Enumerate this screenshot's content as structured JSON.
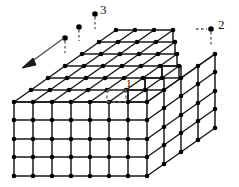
{
  "figure": {
    "width": 239,
    "height": 187,
    "background_color": "#ffffff",
    "line_color": "#1a1a1a",
    "atom_color": "#000000",
    "dashed_color": "#555555",
    "arrow_color": "#1a1a1a"
  },
  "lattice": {
    "front_face": {
      "columns": 7,
      "rows": 4
    },
    "right_face": {
      "columns": 4,
      "rows": 4
    },
    "top_face": {
      "columns": 7,
      "rows": 6
    },
    "step_height_cells": 1,
    "terrace_count": 3
  },
  "labels": [
    {
      "id": "label-1",
      "text": "1",
      "x": 126,
      "y": 83,
      "kind": "kink-site"
    },
    {
      "id": "label-2",
      "text": "2",
      "x": 219,
      "y": 24,
      "kind": "adatom-site"
    },
    {
      "id": "label-3",
      "text": "3",
      "x": 100,
      "y": 8,
      "kind": "terrace-adatom-site"
    }
  ],
  "markers": [
    {
      "id": "marker-3",
      "x": 95,
      "y": 14,
      "leader_to_x": 95,
      "leader_to_y": 30
    },
    {
      "id": "marker-3b",
      "x": 79,
      "y": 27,
      "leader_to_x": 79,
      "leader_to_y": 44
    },
    {
      "id": "marker-arrow",
      "x": 65,
      "y": 38,
      "leader_to_x": 65,
      "leader_to_y": 55
    },
    {
      "id": "marker-2",
      "x": 211,
      "y": 29,
      "leader_to_x": 211,
      "leader_to_y": 46
    }
  ],
  "arrow": {
    "id": "direction-arrow",
    "from_x": 66,
    "from_y": 37,
    "to_x": 26,
    "to_y": 66,
    "head_length": 14
  },
  "dashed_cell": {
    "id": "highlighted-cell",
    "note": "dashed parallelogram marking site 1 on the lower terrace"
  }
}
